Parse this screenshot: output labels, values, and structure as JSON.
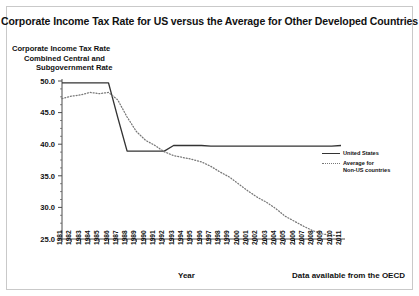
{
  "chart_data": {
    "type": "line",
    "title": "Corporate Income Tax Rate for US versus the Average for Other Developed Countries",
    "ylabel_lines": [
      "Corporate Income Tax Rate",
      "Combined Central and",
      "Subgovernment Rate"
    ],
    "xlabel": "Year",
    "source_note": "Data available from the OECD",
    "categories": [
      "1981",
      "1982",
      "1983",
      "1984",
      "1985",
      "1986",
      "1987",
      "1988",
      "1989",
      "1990",
      "1991",
      "1992",
      "1993",
      "1994",
      "1995",
      "1996",
      "1997",
      "1998",
      "1999",
      "2000",
      "2001",
      "2002",
      "2003",
      "2004",
      "2005",
      "2006",
      "2007",
      "2008",
      "2009",
      "2010",
      "2011"
    ],
    "ylim": [
      25.0,
      50.0
    ],
    "ytick_labels": [
      "50.0",
      "45.0",
      "40.0",
      "35.0",
      "30.0",
      "25.0"
    ],
    "ytick_values": [
      50.0,
      45.0,
      40.0,
      35.0,
      30.0,
      25.0
    ],
    "yminor_step": 1.25,
    "grid": false,
    "legend_position": "right",
    "series": [
      {
        "name": "United States",
        "style": "solid",
        "color": "#333333",
        "values": [
          49.7,
          49.7,
          49.7,
          49.7,
          49.7,
          49.7,
          44.2,
          38.9,
          38.9,
          38.9,
          38.9,
          38.9,
          39.8,
          39.8,
          39.8,
          39.8,
          39.7,
          39.7,
          39.7,
          39.7,
          39.7,
          39.7,
          39.7,
          39.7,
          39.7,
          39.7,
          39.7,
          39.7,
          39.7,
          39.7,
          39.8
        ]
      },
      {
        "name": "Average for\nNon-US countries",
        "style": "dotted",
        "color": "#777777",
        "values": [
          47.2,
          47.6,
          47.8,
          48.2,
          48.0,
          48.2,
          47.0,
          44.3,
          42.0,
          40.6,
          39.8,
          38.8,
          38.2,
          37.9,
          37.6,
          37.2,
          36.5,
          35.6,
          34.8,
          33.7,
          32.6,
          31.6,
          30.8,
          29.8,
          28.6,
          27.8,
          27.0,
          26.3,
          25.8,
          25.6,
          25.5
        ]
      }
    ]
  },
  "legend": {
    "entries": [
      {
        "label": "United States",
        "style": "solid"
      },
      {
        "label": "Average for\nNon-US countries",
        "style": "dotted"
      }
    ]
  }
}
